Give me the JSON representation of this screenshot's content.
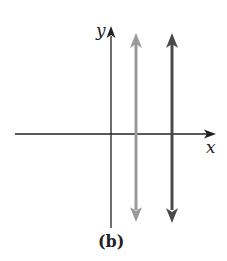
{
  "diagram": {
    "type": "coordinate-plane",
    "caption": "(b)",
    "axes": {
      "x_label": "x",
      "y_label": "y",
      "color": "#222222"
    },
    "lines": [
      {
        "name": "vertical-line-gray",
        "orientation": "vertical",
        "color": "#9a9a9a",
        "arrows": "both"
      },
      {
        "name": "vertical-line-dark",
        "orientation": "vertical",
        "color": "#4a4a4a",
        "arrows": "both"
      }
    ]
  }
}
